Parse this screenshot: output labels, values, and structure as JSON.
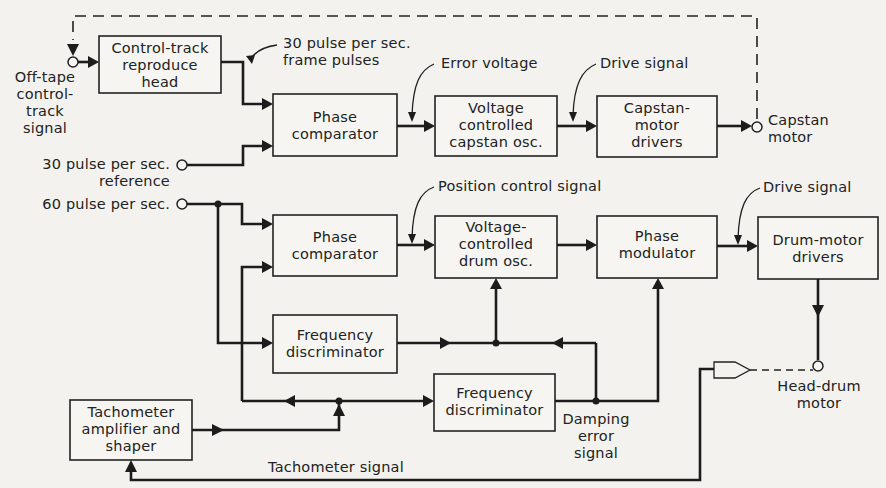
{
  "diagram": {
    "blocks": {
      "control_track_head": "Control-track\nreproduce\nhead",
      "phase_comparator_capstan": "Phase\ncomparator",
      "vco_capstan": "Voltage\ncontrolled\ncapstan osc.",
      "capstan_drivers": "Capstan-\nmotor\ndrivers",
      "phase_comparator_drum": "Phase\ncomparator",
      "vco_drum": "Voltage-\ncontrolled\ndrum osc.",
      "phase_modulator": "Phase\nmodulator",
      "drum_drivers": "Drum-motor\ndrivers",
      "freq_disc_upper": "Frequency\ndiscriminator",
      "freq_disc_lower": "Frequency\ndiscriminator",
      "tach_amp": "Tachometer\namplifier and\nshaper"
    },
    "labels": {
      "off_tape": "Off-tape\ncontrol-\ntrack\nsignal",
      "frame_pulses": "30 pulse per sec.\nframe pulses",
      "error_voltage": "Error voltage",
      "drive_signal_capstan": "Drive signal",
      "capstan_motor": "Capstan\nmotor",
      "ref_30": "30 pulse per sec.\nreference",
      "ref_60": "60 pulse per sec.",
      "position_control": "Position control signal",
      "drive_signal_drum": "Drive signal",
      "head_drum_motor": "Head-drum\nmotor",
      "damping_error": "Damping\nerror\nsignal",
      "tach_signal": "Tachometer signal"
    }
  }
}
